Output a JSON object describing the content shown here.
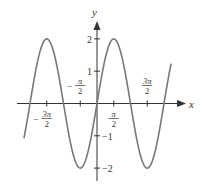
{
  "chart_data": {
    "type": "line",
    "title": "",
    "function": "y = 2 sin x",
    "xlabel": "x",
    "ylabel": "y",
    "x_range": [
      -6.85,
      6.95
    ],
    "ylim": [
      -2.5,
      2.5
    ],
    "grid": false,
    "legend": null,
    "x_ticks": [
      {
        "value": -4.712,
        "label_num": "3π",
        "label_den": "2",
        "sign": "−"
      },
      {
        "value": -1.571,
        "label_num": "π",
        "label_den": "2",
        "sign": "−"
      },
      {
        "value": 1.571,
        "label_num": "π",
        "label_den": "2",
        "sign": ""
      },
      {
        "value": 4.712,
        "label_num": "3π",
        "label_den": "2",
        "sign": ""
      }
    ],
    "y_ticks": [
      {
        "value": 2,
        "label": "2"
      },
      {
        "value": 1,
        "label": "1"
      },
      {
        "value": -1,
        "label": "−1"
      },
      {
        "value": -2,
        "label": "−2"
      }
    ],
    "key_points": [
      {
        "x": -4.712,
        "y": 2
      },
      {
        "x": -3.142,
        "y": 0
      },
      {
        "x": -1.571,
        "y": -2
      },
      {
        "x": 0,
        "y": 0
      },
      {
        "x": 1.571,
        "y": 2
      },
      {
        "x": 3.142,
        "y": 0
      },
      {
        "x": 4.712,
        "y": -2
      },
      {
        "x": 6.283,
        "y": 0
      }
    ],
    "colors": {
      "curve": "#777777",
      "axis": "#333333"
    }
  }
}
